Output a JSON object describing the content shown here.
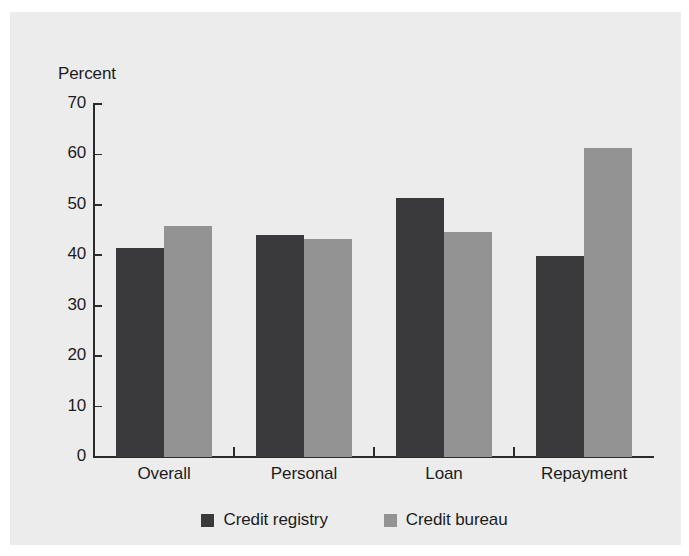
{
  "chart_data": {
    "type": "bar",
    "title": "",
    "subtitle": "",
    "xlabel": "",
    "ylabel": "Percent",
    "ylim": [
      0,
      70
    ],
    "ytick_step": 10,
    "yticks": [
      70,
      60,
      50,
      40,
      30,
      20,
      10,
      0
    ],
    "ytick_labels": [
      "70",
      "60",
      "50",
      "40",
      "30",
      "20",
      "10",
      "0"
    ],
    "grid": false,
    "legend_position": "bottom-center",
    "categories": [
      "Overall",
      "Personal",
      "Loan",
      "Repayment"
    ],
    "series": [
      {
        "name": "Credit registry",
        "color": "#3a3a3c",
        "values": [
          41.4,
          44.0,
          51.4,
          39.8
        ]
      },
      {
        "name": "Credit bureau",
        "color": "#939393",
        "values": [
          45.8,
          43.2,
          44.6,
          61.2
        ]
      }
    ]
  },
  "legend": {
    "items": [
      {
        "label": "Credit registry",
        "color": "#3a3a3c",
        "swatch": "square-swatch-dark"
      },
      {
        "label": "Credit bureau",
        "color": "#939393",
        "swatch": "square-swatch-light"
      }
    ]
  },
  "axis": {
    "y_title": "Percent"
  },
  "colors": {
    "page_background": "#ffffff",
    "panel_background": "#ececec",
    "axis_line": "#2b2b2b",
    "text": "#1c1c1c",
    "series_registry": "#3a3a3c",
    "series_bureau": "#939393"
  }
}
